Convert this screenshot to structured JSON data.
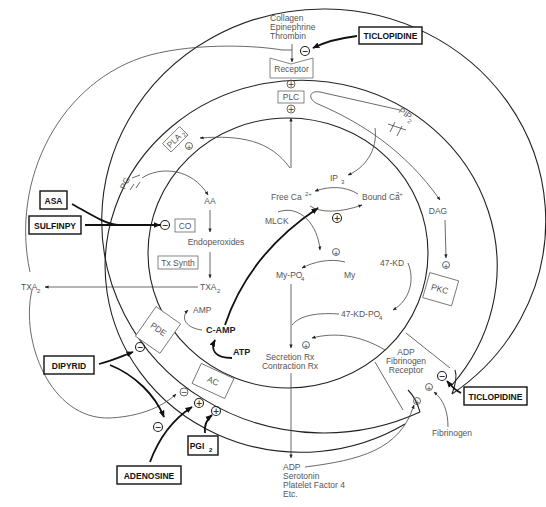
{
  "diagram": {
    "agonists": [
      "Collagen",
      "Epinephrine",
      "Thrombin"
    ],
    "membrane_components": {
      "receptor": "Receptor",
      "plc": "PLC",
      "pla2": "PLA",
      "pla2_sub": "2",
      "pip2": "PIP",
      "pip2_sub": "2",
      "pg": "PG",
      "pde": "PDE",
      "ac": "AC",
      "pkc": "PKC",
      "adp_fib_receptor": [
        "ADP",
        "Fibrinogen",
        "Receptor"
      ]
    },
    "intracellular": {
      "aa": "AA",
      "co": "CO",
      "endoperoxides": "Endoperoxides",
      "tx_synth": "Tx Synth",
      "txa2_inner": "TXA",
      "txa2_inner_sub": "2",
      "amp": "AMP",
      "camp": "C-AMP",
      "atp": "ATP",
      "ip3": "IP",
      "ip3_sub": "3",
      "free_ca": "Free Ca",
      "free_ca_sup": "2+",
      "bound_ca": "Bound Ca",
      "bound_ca_sup": "2+",
      "mlck": "MLCK",
      "my_po4": "My-PO",
      "my_po4_sub": "4",
      "my": "My",
      "kd47": "47-KD",
      "kd47_po4": "47-KD-PO",
      "kd47_po4_sub": "4",
      "dag": "DAG",
      "secretion": "Secretion Rx",
      "contraction": "Contraction Rx"
    },
    "extracellular": {
      "txa2_outer": "TXA",
      "txa2_outer_sub": "2",
      "released": [
        "ADP",
        "Serotonin",
        "Platelet Factor 4",
        "Etc."
      ],
      "fibrinogen": "Fibrinogen"
    },
    "drugs": {
      "ticlopidine_top": "TICLOPIDINE",
      "ticlopidine_bottom": "TICLOPIDINE",
      "asa": "ASA",
      "sulfinpy": "SULFINPY",
      "dipyrid": "DIPYRID",
      "adenosine": "ADENOSINE",
      "pgi2": "PGI",
      "pgi2_sub": "2"
    },
    "symbols": {
      "plus": "+",
      "minus": "−"
    },
    "colors": {
      "line": "#222222",
      "text": "#555555",
      "drug_text": "#111111",
      "background": "#ffffff"
    }
  }
}
